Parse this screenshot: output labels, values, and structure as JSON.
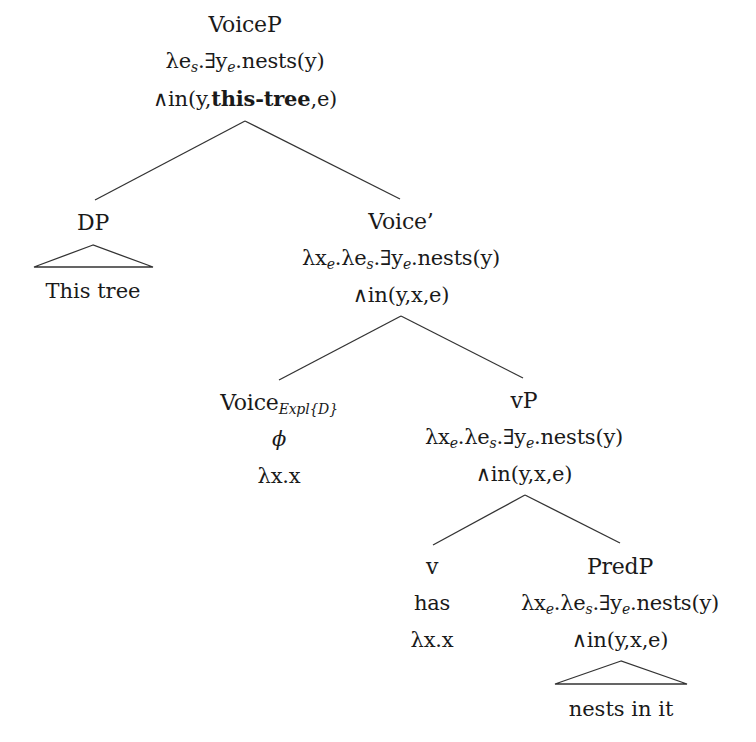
{
  "diagram": {
    "type": "syntax-tree",
    "nodes": {
      "voicep": {
        "label": "VoiceP",
        "sem_line1_parts": [
          "λe",
          "s",
          ".∃y",
          "e",
          ".nests(y)"
        ],
        "sem_line2_prefix": "∧in(y,",
        "sem_line2_bold": "this-tree",
        "sem_line2_suffix": ",e)"
      },
      "dp": {
        "label": "DP",
        "leaf": "This tree"
      },
      "voice_bar": {
        "label": "Voice’",
        "sem_line1_parts": [
          "λx",
          "e",
          ".λe",
          "s",
          ".∃y",
          "e",
          ".nests(y)"
        ],
        "sem_line2": "∧in(y,x,e)"
      },
      "voice_expl": {
        "label": "Voice",
        "label_subscript": "Expl{D}",
        "phon": "ϕ",
        "sem": "λx.x"
      },
      "vp": {
        "label": "vP",
        "sem_line1_parts": [
          "λx",
          "e",
          ".λe",
          "s",
          ".∃y",
          "e",
          ".nests(y)"
        ],
        "sem_line2": "∧in(y,x,e)"
      },
      "v": {
        "label": "v",
        "phon": "has",
        "sem": "λx.x"
      },
      "predp": {
        "label": "PredP",
        "sem_line1_parts": [
          "λx",
          "e",
          ".λe",
          "s",
          ".∃y",
          "e",
          ".nests(y)"
        ],
        "sem_line2": "∧in(y,x,e)",
        "leaf": "nests in it"
      }
    },
    "edges": [
      [
        "VoiceP",
        "DP"
      ],
      [
        "VoiceP",
        "Voice’"
      ],
      [
        "Voice’",
        "Voice_Expl{D}"
      ],
      [
        "Voice’",
        "vP"
      ],
      [
        "vP",
        "v"
      ],
      [
        "vP",
        "PredP"
      ]
    ],
    "colors": {
      "line": "#333333",
      "text": "#1a1a1a",
      "background": "#ffffff"
    }
  }
}
